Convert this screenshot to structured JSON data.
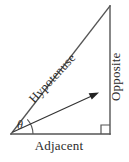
{
  "figure": {
    "type": "right-triangle-trigonometry-diagram",
    "background_color": "#ffffff",
    "stroke_color": "#555555",
    "text_color": "#2b2b2b",
    "labels": {
      "hypotenuse": "Hypotenuse",
      "opposite": "Opposite",
      "adjacent": "Adjacent",
      "angle": "θ"
    },
    "geometry": {
      "vertex_angle": [
        11,
        134
      ],
      "vertex_right": [
        110,
        134
      ],
      "vertex_top": [
        110,
        6
      ],
      "arrow_start": [
        13,
        132
      ],
      "arrow_end": [
        98,
        93
      ],
      "right_angle_marker_size": 9,
      "angle_arc_radius": 22
    }
  }
}
